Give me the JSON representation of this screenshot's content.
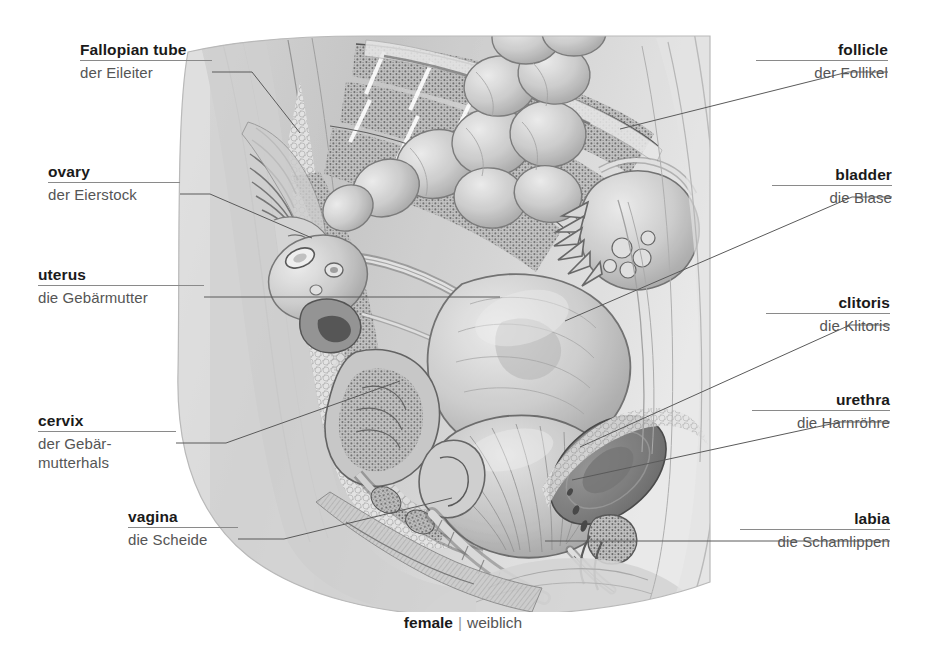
{
  "diagram": {
    "title_en": "female",
    "separator": "|",
    "title_de": "weiblich",
    "ink_color": "#555555",
    "rule_color": "#8a8a8a",
    "leader_color": "#5a5a5a",
    "background": "#ffffff"
  },
  "labels_left": [
    {
      "en": "Fallopian tube",
      "de": "der Eileiter",
      "name": "fallopian-tube"
    },
    {
      "en": "ovary",
      "de": "der Eierstock",
      "name": "ovary"
    },
    {
      "en": "uterus",
      "de": "die Gebärmutter",
      "name": "uterus"
    },
    {
      "en": "cervix",
      "de": "der Gebär-",
      "de2": "mutterhals",
      "name": "cervix"
    },
    {
      "en": "vagina",
      "de": "die Scheide",
      "name": "vagina"
    }
  ],
  "labels_right": [
    {
      "en": "follicle",
      "de": "der Follikel",
      "name": "follicle"
    },
    {
      "en": "bladder",
      "de": "die Blase",
      "name": "bladder"
    },
    {
      "en": "clitoris",
      "de": "die Klitoris",
      "name": "clitoris"
    },
    {
      "en": "urethra",
      "de": "die Harnröhre",
      "name": "urethra"
    },
    {
      "en": "labia",
      "de": "die Schamlippen",
      "name": "labia"
    }
  ]
}
